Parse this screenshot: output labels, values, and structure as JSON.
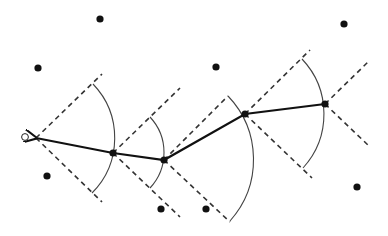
{
  "diagram": {
    "width": 388,
    "height": 236,
    "colors": {
      "background": "#ffffff",
      "line": "#111111",
      "dashed": "#333333",
      "arc": "#444444"
    },
    "start_point": {
      "x": 25,
      "y": 137,
      "style": "open-circle"
    },
    "path_nodes": [
      {
        "x": 36,
        "y": 138
      },
      {
        "x": 113,
        "y": 153
      },
      {
        "x": 164,
        "y": 160
      },
      {
        "x": 245,
        "y": 114
      },
      {
        "x": 325,
        "y": 104
      }
    ],
    "cones": [
      {
        "apex": [
          36,
          138
        ],
        "upper": [
          102,
          74
        ],
        "lower": [
          102,
          202
        ],
        "arc": {
          "start": [
            93,
            84
          ],
          "end": [
            92,
            193
          ],
          "r": 78
        }
      },
      {
        "apex": [
          113,
          153
        ],
        "upper": [
          180,
          88
        ],
        "lower": [
          180,
          217
        ],
        "arc": {
          "start": [
            150,
            117
          ],
          "end": [
            150,
            188
          ],
          "r": 52
        }
      },
      {
        "apex": [
          164,
          160
        ],
        "upper": [
          228,
          96
        ],
        "lower": [
          230,
          222
        ],
        "arc": {
          "start": [
            228,
            96
          ],
          "end": [
            230,
            221
          ],
          "r": 92
        }
      },
      {
        "apex": [
          245,
          114
        ],
        "upper": [
          310,
          50
        ],
        "lower": [
          312,
          178
        ],
        "arc": {
          "start": [
            302,
            59
          ],
          "end": [
            303,
            168
          ],
          "r": 80
        }
      },
      {
        "apex": [
          325,
          104
        ],
        "upper": [
          368,
          62
        ],
        "lower": [
          369,
          146
        ],
        "arc": null
      }
    ],
    "obstacles": [
      {
        "x": 100,
        "y": 19
      },
      {
        "x": 38,
        "y": 68
      },
      {
        "x": 216,
        "y": 67
      },
      {
        "x": 344,
        "y": 24
      },
      {
        "x": 47,
        "y": 176
      },
      {
        "x": 161,
        "y": 209
      },
      {
        "x": 206,
        "y": 209
      },
      {
        "x": 357,
        "y": 187
      }
    ]
  }
}
